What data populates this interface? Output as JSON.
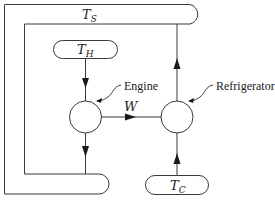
{
  "diagram": {
    "reservoirs": {
      "surroundings": {
        "symbol": "T",
        "subscript": "S"
      },
      "hot": {
        "symbol": "T",
        "subscript": "H"
      },
      "cold": {
        "symbol": "T",
        "subscript": "C"
      }
    },
    "devices": {
      "engine": {
        "label": "Engine"
      },
      "refrigerator": {
        "label": "Refrigerator"
      }
    },
    "work": {
      "label": "W"
    },
    "flows": [
      {
        "from": "hot",
        "to": "engine"
      },
      {
        "from": "engine",
        "to": "surroundings"
      },
      {
        "from": "engine",
        "to": "refrigerator",
        "label": "W"
      },
      {
        "from": "cold",
        "to": "refrigerator"
      },
      {
        "from": "refrigerator",
        "to": "surroundings"
      }
    ],
    "colors": {
      "line": "#3a3a3a",
      "arrow": "#1a1a1a",
      "background": "#ffffff"
    }
  }
}
